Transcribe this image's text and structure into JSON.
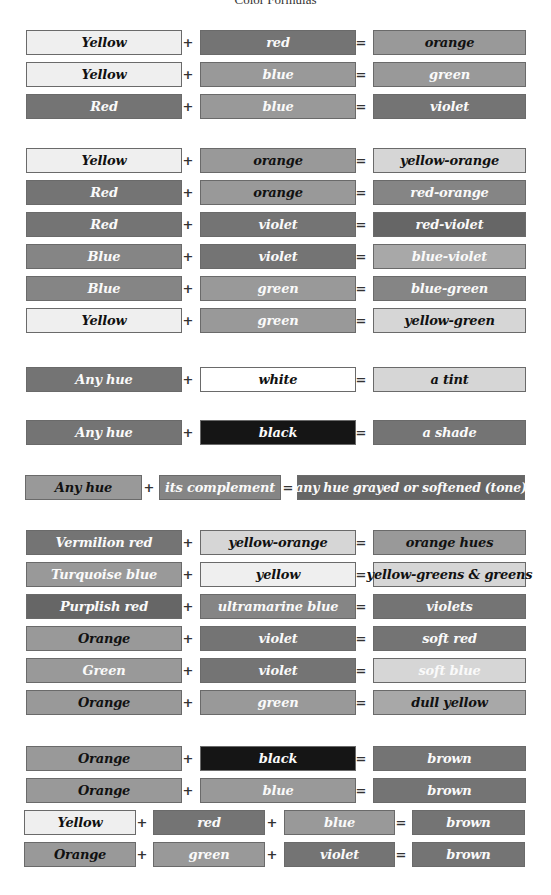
{
  "title": "Color Formulas",
  "tones": {
    "pale": "#efefef",
    "white": "#ffffff",
    "light": "#d6d6d6",
    "lightmid": "#a8a8a8",
    "mid": "#999999",
    "middark": "#858585",
    "dark": "#747474",
    "darker": "#666666",
    "black": "#151515"
  },
  "groups": [
    {
      "rows": [
        {
          "terms": [
            {
              "label": "Yellow",
              "tone": "pale",
              "text": "dark"
            },
            {
              "label": "red",
              "tone": "dark",
              "text": "light"
            }
          ],
          "result": {
            "label": "orange",
            "tone": "mid",
            "text": "dark"
          }
        },
        {
          "terms": [
            {
              "label": "Yellow",
              "tone": "pale",
              "text": "dark"
            },
            {
              "label": "blue",
              "tone": "mid",
              "text": "light"
            }
          ],
          "result": {
            "label": "green",
            "tone": "mid",
            "text": "light"
          }
        },
        {
          "terms": [
            {
              "label": "Red",
              "tone": "dark",
              "text": "light"
            },
            {
              "label": "blue",
              "tone": "mid",
              "text": "light"
            }
          ],
          "result": {
            "label": "violet",
            "tone": "dark",
            "text": "light"
          }
        }
      ]
    },
    {
      "rows": [
        {
          "terms": [
            {
              "label": "Yellow",
              "tone": "pale",
              "text": "dark"
            },
            {
              "label": "orange",
              "tone": "mid",
              "text": "dark"
            }
          ],
          "result": {
            "label": "yellow-orange",
            "tone": "light",
            "text": "dark"
          }
        },
        {
          "terms": [
            {
              "label": "Red",
              "tone": "dark",
              "text": "light"
            },
            {
              "label": "orange",
              "tone": "mid",
              "text": "dark"
            }
          ],
          "result": {
            "label": "red-orange",
            "tone": "middark",
            "text": "light"
          }
        },
        {
          "terms": [
            {
              "label": "Red",
              "tone": "dark",
              "text": "light"
            },
            {
              "label": "violet",
              "tone": "dark",
              "text": "light"
            }
          ],
          "result": {
            "label": "red-violet",
            "tone": "darker",
            "text": "light"
          }
        },
        {
          "terms": [
            {
              "label": "Blue",
              "tone": "middark",
              "text": "light"
            },
            {
              "label": "violet",
              "tone": "dark",
              "text": "light"
            }
          ],
          "result": {
            "label": "blue-violet",
            "tone": "lightmid",
            "text": "light"
          }
        },
        {
          "terms": [
            {
              "label": "Blue",
              "tone": "middark",
              "text": "light"
            },
            {
              "label": "green",
              "tone": "mid",
              "text": "light"
            }
          ],
          "result": {
            "label": "blue-green",
            "tone": "middark",
            "text": "light"
          }
        },
        {
          "terms": [
            {
              "label": "Yellow",
              "tone": "pale",
              "text": "dark"
            },
            {
              "label": "green",
              "tone": "mid",
              "text": "light"
            }
          ],
          "result": {
            "label": "yellow-green",
            "tone": "light",
            "text": "dark"
          }
        }
      ]
    },
    {
      "rows": [
        {
          "terms": [
            {
              "label": "Any hue",
              "tone": "dark",
              "text": "light"
            },
            {
              "label": "white",
              "tone": "white",
              "text": "dark"
            }
          ],
          "result": {
            "label": "a tint",
            "tone": "light",
            "text": "dark"
          }
        }
      ]
    },
    {
      "rows": [
        {
          "terms": [
            {
              "label": "Any hue",
              "tone": "dark",
              "text": "light"
            },
            {
              "label": "black",
              "tone": "black",
              "text": "light"
            }
          ],
          "result": {
            "label": "a shade",
            "tone": "dark",
            "text": "light"
          }
        }
      ]
    },
    {
      "rows": [
        {
          "terms": [
            {
              "label": "Any hue",
              "tone": "mid",
              "text": "dark"
            },
            {
              "label": "its complement",
              "tone": "middark",
              "text": "light"
            }
          ],
          "result": {
            "label": "any hue grayed or softened (tone)",
            "tone": "darker",
            "text": "light"
          }
        }
      ]
    },
    {
      "rows": [
        {
          "terms": [
            {
              "label": "Vermilion red",
              "tone": "dark",
              "text": "light"
            },
            {
              "label": "yellow-orange",
              "tone": "light",
              "text": "dark"
            }
          ],
          "result": {
            "label": "orange hues",
            "tone": "mid",
            "text": "dark"
          }
        },
        {
          "terms": [
            {
              "label": "Turquoise blue",
              "tone": "mid",
              "text": "light"
            },
            {
              "label": "yellow",
              "tone": "pale",
              "text": "dark"
            }
          ],
          "result": {
            "label": "yellow-greens & greens",
            "tone": "light",
            "text": "dark"
          }
        },
        {
          "terms": [
            {
              "label": "Purplish red",
              "tone": "darker",
              "text": "light"
            },
            {
              "label": "ultramarine blue",
              "tone": "middark",
              "text": "light"
            }
          ],
          "result": {
            "label": "violets",
            "tone": "dark",
            "text": "light"
          }
        },
        {
          "terms": [
            {
              "label": "Orange",
              "tone": "mid",
              "text": "dark"
            },
            {
              "label": "violet",
              "tone": "dark",
              "text": "light"
            }
          ],
          "result": {
            "label": "soft red",
            "tone": "dark",
            "text": "light"
          }
        },
        {
          "terms": [
            {
              "label": "Green",
              "tone": "mid",
              "text": "light"
            },
            {
              "label": "violet",
              "tone": "dark",
              "text": "light"
            }
          ],
          "result": {
            "label": "soft blue",
            "tone": "light",
            "text": "light"
          }
        },
        {
          "terms": [
            {
              "label": "Orange",
              "tone": "mid",
              "text": "dark"
            },
            {
              "label": "green",
              "tone": "mid",
              "text": "light"
            }
          ],
          "result": {
            "label": "dull yellow",
            "tone": "lightmid",
            "text": "dark"
          }
        }
      ]
    },
    {
      "rows": [
        {
          "terms": [
            {
              "label": "Orange",
              "tone": "mid",
              "text": "dark"
            },
            {
              "label": "black",
              "tone": "black",
              "text": "light"
            }
          ],
          "result": {
            "label": "brown",
            "tone": "dark",
            "text": "light"
          }
        },
        {
          "terms": [
            {
              "label": "Orange",
              "tone": "mid",
              "text": "dark"
            },
            {
              "label": "blue",
              "tone": "mid",
              "text": "light"
            }
          ],
          "result": {
            "label": "brown",
            "tone": "dark",
            "text": "light"
          }
        },
        {
          "terms": [
            {
              "label": "Yellow",
              "tone": "pale",
              "text": "dark"
            },
            {
              "label": "red",
              "tone": "dark",
              "text": "light"
            },
            {
              "label": "blue",
              "tone": "mid",
              "text": "light"
            }
          ],
          "result": {
            "label": "brown",
            "tone": "dark",
            "text": "light"
          }
        },
        {
          "terms": [
            {
              "label": "Orange",
              "tone": "mid",
              "text": "dark"
            },
            {
              "label": "green",
              "tone": "mid",
              "text": "light"
            },
            {
              "label": "violet",
              "tone": "dark",
              "text": "light"
            }
          ],
          "result": {
            "label": "brown",
            "tone": "dark",
            "text": "light"
          }
        }
      ]
    }
  ],
  "operators": {
    "plus": "+",
    "equals": "="
  }
}
